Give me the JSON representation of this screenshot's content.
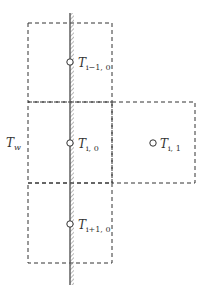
{
  "diagram": {
    "type": "finite-difference grid near wall",
    "colors": {
      "stroke": "#333333",
      "wall": "#555555",
      "hatch": "#888888",
      "background": "#ffffff"
    },
    "wall": {
      "x": 70,
      "y_top": 13,
      "y_bottom": 285
    },
    "cells": [
      {
        "id": "cell-i-minus-1-0",
        "x": 28,
        "y": 23,
        "w": 84,
        "h": 79
      },
      {
        "id": "cell-i-0",
        "x": 28,
        "y": 102,
        "w": 84,
        "h": 81
      },
      {
        "id": "cell-i-1",
        "x": 112,
        "y": 102,
        "w": 83,
        "h": 81
      },
      {
        "id": "cell-i-plus-1-0",
        "x": 28,
        "y": 183,
        "w": 84,
        "h": 80
      }
    ],
    "nodes": [
      {
        "id": "node-i-minus-1-0",
        "cx": 70,
        "cy": 62,
        "label_main": "T",
        "label_sub": "i−1, 0"
      },
      {
        "id": "node-i-0",
        "cx": 70,
        "cy": 143,
        "label_main": "T",
        "label_sub": "i, 0"
      },
      {
        "id": "node-i-1",
        "cx": 153,
        "cy": 143,
        "label_main": "T",
        "label_sub": "i, 1"
      },
      {
        "id": "node-i-plus-1-0",
        "cx": 70,
        "cy": 224,
        "label_main": "T",
        "label_sub": "i+1, 0"
      }
    ],
    "wall_label": {
      "main": "T",
      "sub": "w"
    }
  }
}
